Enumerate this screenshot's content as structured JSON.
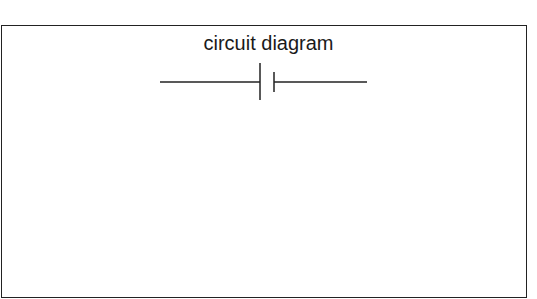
{
  "diagram": {
    "title": "circuit diagram",
    "symbol": "battery-cell",
    "stroke_color": "#222222"
  }
}
